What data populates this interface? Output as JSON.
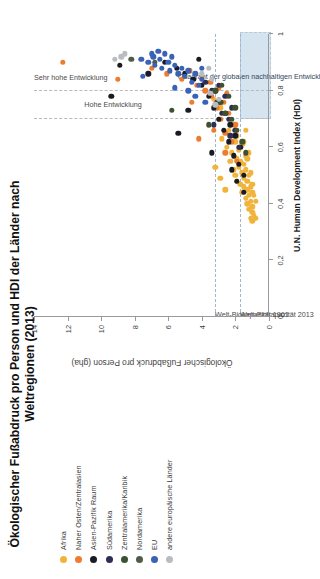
{
  "chart_data": {
    "type": "scatter",
    "title": "Ökologischer Fußabdruck pro Person und HDI der Länder nach Weltregionen (2013)",
    "xlabel": "U.N. Human Development Index (HDI)",
    "ylabel": "Ökologischer Fußabdruck pro Person (gha)",
    "xlim": [
      0,
      1
    ],
    "ylim": [
      0,
      14
    ],
    "xticks": [
      "0",
      "0,2",
      "0,4",
      "0,6",
      "0,8",
      "1"
    ],
    "xtick_values": [
      0,
      0.2,
      0.4,
      0.6,
      0.8,
      1
    ],
    "yticks": [
      "0",
      "2",
      "4",
      "6",
      "8",
      "10",
      "12",
      "14"
    ],
    "ytick_values": [
      0,
      2,
      4,
      6,
      8,
      10,
      12,
      14
    ],
    "grid": false,
    "legend_position": "left",
    "reference_lines": [
      {
        "orientation": "horizontal",
        "value": 3.2,
        "label": "Welt-Biokapazität 1961",
        "style": "dashed"
      },
      {
        "orientation": "horizontal",
        "value": 1.7,
        "label": "Welt-Biokapazität 2013",
        "style": "dashed"
      },
      {
        "orientation": "vertical",
        "value": 0.7,
        "label": "Hohe Entwicklung",
        "style": "dashed"
      },
      {
        "orientation": "vertical",
        "value": 0.8,
        "label": "Sehr hohe Entwicklung",
        "style": "dashed"
      }
    ],
    "annotations": [
      {
        "text": "Quadrant der globalen nachhaltigen Entwicklung",
        "x_range": [
          0.7,
          1.0
        ],
        "y_range": [
          0,
          1.7
        ]
      },
      {
        "text": "Sehr hohe Entwicklung",
        "x": 0.86
      },
      {
        "text": "Hohe Entwicklung",
        "x": 0.75
      }
    ],
    "series": [
      {
        "name": "Afrika",
        "color": "#f0b43c",
        "points": [
          [
            0.34,
            1.0
          ],
          [
            0.35,
            1.1
          ],
          [
            0.37,
            1.0
          ],
          [
            0.38,
            1.2
          ],
          [
            0.39,
            1.0
          ],
          [
            0.4,
            1.3
          ],
          [
            0.41,
            1.1
          ],
          [
            0.42,
            1.4
          ],
          [
            0.43,
            1.2
          ],
          [
            0.44,
            1.6
          ],
          [
            0.44,
            1.0
          ],
          [
            0.45,
            1.3
          ],
          [
            0.46,
            1.5
          ],
          [
            0.46,
            1.1
          ],
          [
            0.47,
            1.7
          ],
          [
            0.48,
            1.3
          ],
          [
            0.48,
            1.9
          ],
          [
            0.49,
            1.5
          ],
          [
            0.5,
            1.2
          ],
          [
            0.5,
            2.0
          ],
          [
            0.51,
            1.6
          ],
          [
            0.52,
            1.4
          ],
          [
            0.52,
            2.1
          ],
          [
            0.53,
            1.8
          ],
          [
            0.54,
            1.5
          ],
          [
            0.55,
            2.3
          ],
          [
            0.55,
            1.7
          ],
          [
            0.56,
            1.9
          ],
          [
            0.57,
            1.4
          ],
          [
            0.58,
            2.2
          ],
          [
            0.59,
            1.8
          ],
          [
            0.6,
            2.5
          ],
          [
            0.61,
            1.6
          ],
          [
            0.62,
            2.0
          ],
          [
            0.63,
            2.8
          ],
          [
            0.64,
            1.9
          ],
          [
            0.66,
            2.4
          ],
          [
            0.68,
            2.1
          ],
          [
            0.7,
            3.0
          ],
          [
            0.72,
            2.6
          ],
          [
            0.35,
            0.8
          ],
          [
            0.36,
            0.9
          ],
          [
            0.41,
            0.8
          ],
          [
            0.43,
            0.9
          ],
          [
            0.47,
            1.0
          ],
          [
            0.51,
            1.1
          ],
          [
            0.56,
            1.3
          ],
          [
            0.58,
            1.2
          ],
          [
            0.62,
            1.5
          ],
          [
            0.66,
            1.4
          ],
          [
            0.74,
            2.9
          ],
          [
            0.77,
            3.3
          ],
          [
            0.45,
            2.6
          ],
          [
            0.49,
            2.9
          ],
          [
            0.53,
            3.2
          ]
        ]
      },
      {
        "name": "Naher Osten/Zentralasien",
        "color": "#ec7c30",
        "points": [
          [
            0.55,
            1.9
          ],
          [
            0.62,
            2.2
          ],
          [
            0.65,
            2.6
          ],
          [
            0.68,
            2.0
          ],
          [
            0.7,
            2.9
          ],
          [
            0.72,
            2.4
          ],
          [
            0.74,
            3.1
          ],
          [
            0.76,
            2.7
          ],
          [
            0.78,
            3.4
          ],
          [
            0.79,
            2.5
          ],
          [
            0.8,
            3.8
          ],
          [
            0.81,
            3.0
          ],
          [
            0.82,
            4.3
          ],
          [
            0.83,
            3.5
          ],
          [
            0.84,
            5.2
          ],
          [
            0.85,
            4.0
          ],
          [
            0.86,
            6.1
          ],
          [
            0.87,
            4.7
          ],
          [
            0.88,
            7.0
          ],
          [
            0.84,
            9.0
          ],
          [
            0.9,
            12.3
          ],
          [
            0.66,
            3.3
          ],
          [
            0.58,
            2.6
          ],
          [
            0.63,
            4.2
          ],
          [
            0.76,
            4.6
          ]
        ]
      },
      {
        "name": "Asien-Pazifik Raum",
        "color": "#1a1a22",
        "points": [
          [
            0.5,
            1.5
          ],
          [
            0.54,
            1.8
          ],
          [
            0.57,
            2.1
          ],
          [
            0.6,
            1.7
          ],
          [
            0.62,
            2.4
          ],
          [
            0.64,
            2.0
          ],
          [
            0.66,
            2.7
          ],
          [
            0.68,
            2.3
          ],
          [
            0.7,
            3.0
          ],
          [
            0.72,
            2.6
          ],
          [
            0.74,
            3.3
          ],
          [
            0.76,
            2.9
          ],
          [
            0.78,
            3.6
          ],
          [
            0.8,
            3.2
          ],
          [
            0.82,
            4.0
          ],
          [
            0.84,
            4.5
          ],
          [
            0.86,
            5.0
          ],
          [
            0.88,
            5.5
          ],
          [
            0.9,
            6.2
          ],
          [
            0.91,
            4.2
          ],
          [
            0.89,
            8.9
          ],
          [
            0.78,
            9.4
          ],
          [
            0.58,
            3.4
          ],
          [
            0.52,
            2.2
          ],
          [
            0.48,
            1.9
          ],
          [
            0.44,
            1.5
          ],
          [
            0.65,
            5.4
          ],
          [
            0.73,
            4.8
          ],
          [
            0.86,
            7.2
          ]
        ]
      },
      {
        "name": "Südamerika",
        "color": "#2d2d55",
        "points": [
          [
            0.66,
            2.0
          ],
          [
            0.7,
            2.4
          ],
          [
            0.72,
            2.8
          ],
          [
            0.74,
            2.2
          ],
          [
            0.76,
            3.1
          ],
          [
            0.78,
            2.6
          ],
          [
            0.8,
            3.4
          ],
          [
            0.82,
            3.0
          ],
          [
            0.83,
            3.8
          ],
          [
            0.6,
            1.8
          ],
          [
            0.64,
            2.3
          ],
          [
            0.68,
            3.3
          ]
        ]
      },
      {
        "name": "Zentralamerika/Karibik",
        "color": "#3d5030",
        "points": [
          [
            0.62,
            1.6
          ],
          [
            0.66,
            1.9
          ],
          [
            0.7,
            2.2
          ],
          [
            0.72,
            2.6
          ],
          [
            0.74,
            2.0
          ],
          [
            0.76,
            2.9
          ],
          [
            0.78,
            2.4
          ],
          [
            0.8,
            3.2
          ],
          [
            0.58,
            1.4
          ],
          [
            0.68,
            3.6
          ],
          [
            0.73,
            5.8
          ],
          [
            0.82,
            2.8
          ]
        ]
      },
      {
        "name": "Nordamerika",
        "color": "#4f5d47",
        "points": [
          [
            0.9,
            6.8
          ],
          [
            0.91,
            8.2
          ]
        ]
      },
      {
        "name": "EU",
        "color": "#3a62b5",
        "points": [
          [
            0.82,
            4.2
          ],
          [
            0.83,
            4.6
          ],
          [
            0.84,
            4.0
          ],
          [
            0.85,
            5.0
          ],
          [
            0.86,
            4.4
          ],
          [
            0.86,
            5.4
          ],
          [
            0.87,
            4.8
          ],
          [
            0.87,
            5.9
          ],
          [
            0.88,
            5.2
          ],
          [
            0.88,
            6.4
          ],
          [
            0.89,
            5.6
          ],
          [
            0.89,
            6.8
          ],
          [
            0.9,
            6.0
          ],
          [
            0.9,
            7.2
          ],
          [
            0.91,
            6.5
          ],
          [
            0.91,
            7.6
          ],
          [
            0.92,
            5.8
          ],
          [
            0.92,
            6.9
          ],
          [
            0.93,
            7.0
          ],
          [
            0.93,
            6.2
          ],
          [
            0.8,
            4.8
          ],
          [
            0.81,
            5.6
          ],
          [
            0.85,
            7.5
          ],
          [
            0.88,
            4.0
          ],
          [
            0.94,
            6.6
          ],
          [
            0.78,
            4.4
          ],
          [
            0.76,
            3.8
          ]
        ]
      },
      {
        "name": "andere europäische Länder",
        "color": "#b9bcc0",
        "points": [
          [
            0.77,
            3.0
          ],
          [
            0.79,
            3.5
          ],
          [
            0.84,
            3.4
          ],
          [
            0.86,
            4.0
          ],
          [
            0.88,
            3.6
          ],
          [
            0.91,
            9.2
          ],
          [
            0.92,
            8.8
          ],
          [
            0.93,
            8.6
          ],
          [
            0.75,
            3.2
          ]
        ]
      }
    ]
  },
  "legend": {
    "items": [
      {
        "label": "Afrika",
        "color": "#f0b43c"
      },
      {
        "label": "Naher Osten/Zentralasien",
        "color": "#ec7c30"
      },
      {
        "label": "Asien-Pazifik Raum",
        "color": "#1a1a22"
      },
      {
        "label": "Südamerika",
        "color": "#2d2d55"
      },
      {
        "label": "Zentralamerika/Karibik",
        "color": "#3d5030"
      },
      {
        "label": "Nordamerika",
        "color": "#4f5d47"
      },
      {
        "label": "EU",
        "color": "#3a62b5"
      },
      {
        "label": "andere europäische Länder",
        "color": "#b9bcc0"
      }
    ]
  },
  "colors": {
    "quadrant_fill": "#cfe0ee",
    "axis": "#9a9a9a",
    "reference_line": "#b9b9b9",
    "biocapacity_line": "#9fb7cf"
  }
}
